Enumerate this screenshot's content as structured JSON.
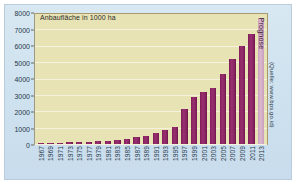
{
  "chart_data": {
    "type": "bar",
    "title": "Anbaufläche in 1000 ha",
    "xlabel": "",
    "ylabel": "",
    "ylim": [
      0,
      8000
    ],
    "yticks": [
      0,
      1000,
      2000,
      3000,
      4000,
      5000,
      6000,
      7000,
      8000
    ],
    "ytick_labels": [
      "0",
      "1000",
      "2000",
      "3000",
      "4000",
      "5000",
      "6000",
      "7000",
      "8000"
    ],
    "grid": true,
    "legend": "none",
    "categories": [
      "1967",
      "1969",
      "1971",
      "1973",
      "1975",
      "1977",
      "1979",
      "1981",
      "1983",
      "1985",
      "1987",
      "1989",
      "1991",
      "1993",
      "1995",
      "1997",
      "1999",
      "2001",
      "2003",
      "2005",
      "2007",
      "2009",
      "2011",
      "2013"
    ],
    "values": [
      60,
      70,
      90,
      110,
      120,
      140,
      160,
      180,
      230,
      300,
      400,
      500,
      650,
      850,
      1050,
      2150,
      2900,
      3200,
      3450,
      4300,
      5200,
      6000,
      6700,
      7700
    ],
    "annotations": [
      {
        "category": "2013",
        "text": "Prognose",
        "style": "forecast-bar"
      }
    ],
    "source_note": "(Quelle: www.bps.go.id)",
    "colors": {
      "bar": "#8b2465",
      "bar_forecast": "#cda2c0",
      "plot_background": "#e7e3b4",
      "card_background": "#d4e4f0",
      "gridline": "#f4f2dc",
      "axis": "#6b6b5a",
      "text": "#25384a"
    }
  }
}
